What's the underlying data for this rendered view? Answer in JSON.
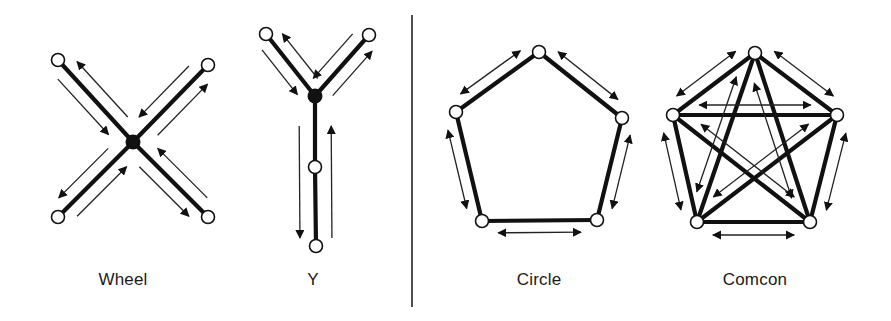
{
  "figure": {
    "divider": {
      "x": 412,
      "y1": 15,
      "y2": 307
    }
  },
  "networks": [
    {
      "id": "wheel",
      "label": "Wheel",
      "label_pos": {
        "x": 123,
        "y": 270
      },
      "hub": {
        "x": 133,
        "y": 142
      },
      "nodes": [
        {
          "x": 58,
          "y": 60
        },
        {
          "x": 208,
          "y": 65
        },
        {
          "x": 58,
          "y": 217
        },
        {
          "x": 208,
          "y": 217
        }
      ],
      "edges": [
        [
          0,
          "hub"
        ],
        [
          1,
          "hub"
        ],
        [
          2,
          "hub"
        ],
        [
          3,
          "hub"
        ]
      ],
      "communication": "each member communicates only with the central hub (two-way)"
    },
    {
      "id": "y",
      "label": "Y",
      "label_pos": {
        "x": 313,
        "y": 270
      },
      "hub": {
        "x": 315,
        "y": 96
      },
      "nodes": [
        {
          "x": 266,
          "y": 34
        },
        {
          "x": 369,
          "y": 35
        },
        {
          "x": 315,
          "y": 167
        },
        {
          "x": 316,
          "y": 246
        }
      ],
      "edges": [
        [
          0,
          "hub"
        ],
        [
          1,
          "hub"
        ],
        [
          "hub",
          2
        ],
        [
          2,
          3
        ]
      ],
      "communication": "two members feed a hub which relays down a chain (two-way)"
    },
    {
      "id": "circle",
      "label": "Circle",
      "label_pos": {
        "x": 539,
        "y": 270
      },
      "nodes": [
        {
          "x": 539,
          "y": 52
        },
        {
          "x": 622,
          "y": 118
        },
        {
          "x": 597,
          "y": 220
        },
        {
          "x": 482,
          "y": 221
        },
        {
          "x": 456,
          "y": 112
        }
      ],
      "edges": [
        [
          0,
          1
        ],
        [
          1,
          2
        ],
        [
          2,
          3
        ],
        [
          3,
          4
        ],
        [
          4,
          0
        ]
      ],
      "communication": "each member communicates with two neighbors (two-way)"
    },
    {
      "id": "comcon",
      "label": "Comcon",
      "label_pos": {
        "x": 755,
        "y": 270
      },
      "nodes": [
        {
          "x": 755,
          "y": 53
        },
        {
          "x": 837,
          "y": 115
        },
        {
          "x": 810,
          "y": 222
        },
        {
          "x": 697,
          "y": 222
        },
        {
          "x": 673,
          "y": 115
        }
      ],
      "edges": [
        [
          0,
          1
        ],
        [
          1,
          2
        ],
        [
          2,
          3
        ],
        [
          3,
          4
        ],
        [
          4,
          0
        ],
        [
          0,
          2
        ],
        [
          0,
          3
        ],
        [
          1,
          3
        ],
        [
          1,
          4
        ],
        [
          2,
          4
        ]
      ],
      "communication": "all-channel: every member communicates with every other (two-way)"
    }
  ]
}
